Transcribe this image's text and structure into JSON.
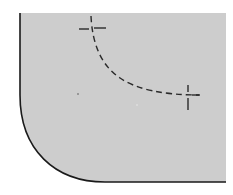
{
  "diagram": {
    "type": "technical-drawing",
    "colors": {
      "background": "#ffffff",
      "plate_fill": "#cdcdcd",
      "outline": "#1a1a1a",
      "dashed_line": "#2a2a2a"
    },
    "plate": {
      "left": 20,
      "top": 13,
      "right": 226,
      "bottom": 182,
      "corner_curve_start_y": 95,
      "corner_curve_end_x": 105
    },
    "dashed_arc": {
      "start": [
        91,
        16
      ],
      "end": [
        199,
        95
      ],
      "center": [
        188,
        28
      ],
      "rx": 95,
      "ry": 67
    },
    "crosshairs": [
      {
        "name": "upper-left",
        "cx": 93,
        "cy": 28
      },
      {
        "name": "lower-right",
        "cx": 188,
        "cy": 95
      }
    ]
  }
}
